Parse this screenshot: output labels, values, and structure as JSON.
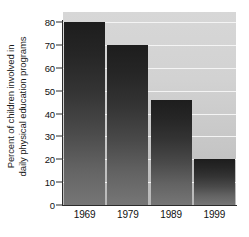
{
  "chart_data": {
    "type": "bar",
    "title": "",
    "xlabel": "",
    "ylabel_line1": "Percent of children involved in",
    "ylabel_line2": "daily physical education programs",
    "categories": [
      "1969",
      "1979",
      "1989",
      "1999"
    ],
    "values": [
      80,
      70,
      46,
      20
    ],
    "ylim": [
      0,
      80
    ],
    "ytick_labels": [
      "0",
      "10",
      "20",
      "30",
      "40",
      "50",
      "60",
      "70",
      "80"
    ],
    "ytick_values": [
      0,
      10,
      20,
      30,
      40,
      50,
      60,
      70,
      80
    ],
    "grid": true,
    "legend": "none",
    "bar_color": "#2e2e2e",
    "plot_background": "#d0d0d0",
    "gridline_color": "#f4f4f4",
    "axis_color": "#2b2b2b"
  }
}
